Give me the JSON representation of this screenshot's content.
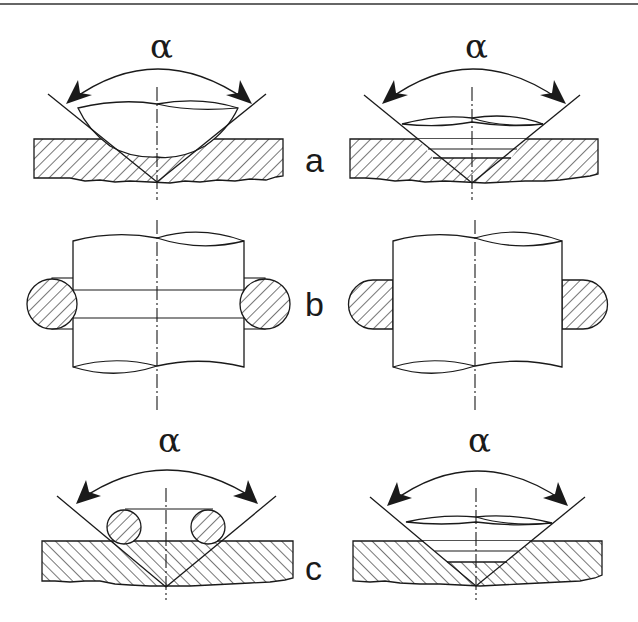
{
  "figure": {
    "angle_symbol": "α",
    "rows": [
      {
        "label": "a",
        "left_angle_label": "α",
        "right_angle_label": "α"
      },
      {
        "label": "b"
      },
      {
        "label": "c",
        "left_angle_label": "α",
        "right_angle_label": "α"
      }
    ],
    "colors": {
      "ink": "#1a1a1a",
      "background": "#ffffff"
    }
  }
}
